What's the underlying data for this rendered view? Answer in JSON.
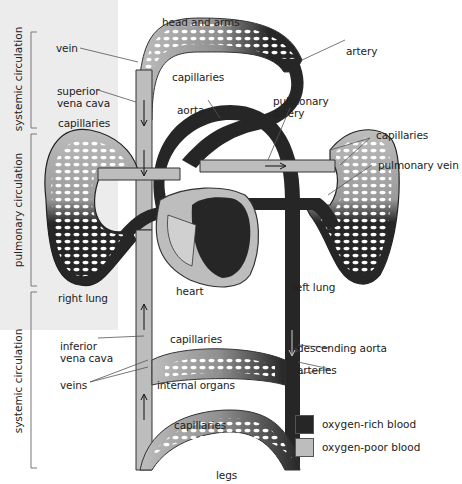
{
  "colors": {
    "oxygen_rich": "#262626",
    "oxygen_poor": "#bdbdbd",
    "panel": "#ececec",
    "outline": "#3a3a3a"
  },
  "brackets": [
    {
      "label": "systemic circulation",
      "position": "top"
    },
    {
      "label": "pulmonary circulation",
      "position": "middle"
    },
    {
      "label": "systemic circulation",
      "position": "bottom"
    }
  ],
  "labels": {
    "head_and_arms": "head and arms",
    "vein": "vein",
    "artery": "artery",
    "capillaries_top": "capillaries",
    "superior_vena_cava_1": "superior",
    "superior_vena_cava_2": "vena cava",
    "aorta": "aorta",
    "pulmonary_artery_1": "pulmonary",
    "pulmonary_artery_2": "artery",
    "capillaries_left_lung": "capillaries",
    "capillaries_right_side": "capillaries",
    "pulmonary_vein": "pulmonary vein",
    "heart": "heart",
    "right_lung": "right lung",
    "left_lung": "left lung",
    "inferior_vena_cava_1": "inferior",
    "inferior_vena_cava_2": "vena cava",
    "capillaries_organs": "capillaries",
    "descending_aorta": "descending aorta",
    "arteries": "arteries",
    "veins": "veins",
    "internal_organs": "internal organs",
    "capillaries_legs": "capillaries",
    "legs": "legs"
  },
  "legend": [
    {
      "label": "oxygen-rich blood",
      "color": "#262626"
    },
    {
      "label": "oxygen-poor blood",
      "color": "#bdbdbd"
    }
  ]
}
